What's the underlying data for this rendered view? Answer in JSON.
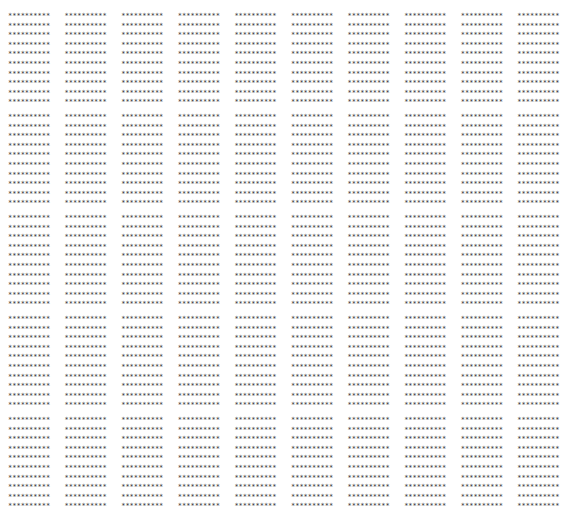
{
  "pattern": {
    "line_text": "**********",
    "lines_per_block": 10,
    "blocks_per_row": 10,
    "row_groups": 5,
    "text_color": "#333333",
    "background": "#ffffff"
  }
}
